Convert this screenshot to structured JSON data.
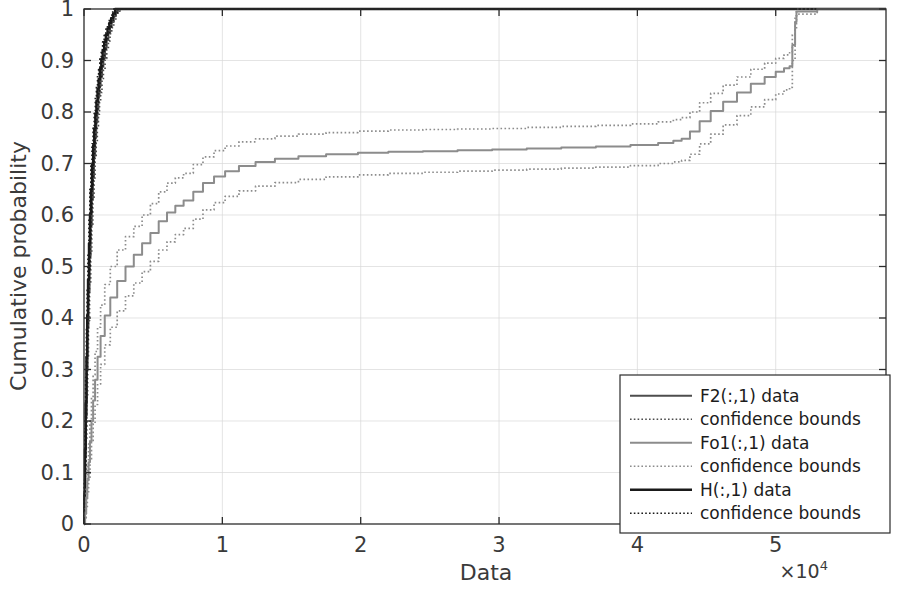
{
  "figure": {
    "title": "",
    "background_color": "#ffffff"
  },
  "axes": {
    "xlabel": "Data",
    "ylabel": "Cumulative probability",
    "x_exponent_label": "×10",
    "x_exponent_power": "4",
    "x_ticks": [
      "0",
      "1",
      "2",
      "3",
      "4",
      "5"
    ],
    "y_ticks": [
      "0",
      "0.1",
      "0.2",
      "0.3",
      "0.4",
      "0.5",
      "0.6",
      "0.7",
      "0.8",
      "0.9",
      "1"
    ]
  },
  "legend": {
    "position": "bottom-right",
    "entries": [
      {
        "label": "F2(:,1) data",
        "style": "solid",
        "color": "#4d4d4d",
        "width": 2.2
      },
      {
        "label": "confidence bounds",
        "style": "dotted",
        "color": "#4d4d4d",
        "width": 1.6
      },
      {
        "label": "Fo1(:,1) data",
        "style": "solid",
        "color": "#8c8c8c",
        "width": 2.0
      },
      {
        "label": "confidence bounds",
        "style": "dotted",
        "color": "#8c8c8c",
        "width": 1.6
      },
      {
        "label": "H(:,1) data",
        "style": "solid",
        "color": "#1a1a1a",
        "width": 2.6
      },
      {
        "label": "confidence bounds",
        "style": "dotted",
        "color": "#1a1a1a",
        "width": 1.6
      }
    ]
  },
  "chart_data": {
    "type": "line",
    "title": "",
    "xlabel": "Data",
    "ylabel": "Cumulative probability",
    "xlim": [
      0,
      57971
    ],
    "ylim": [
      0,
      1
    ],
    "x_scale_factor": 10000,
    "grid": true,
    "legend_position": "lower right",
    "series": [
      {
        "name": "F2(:,1) data",
        "style": "solid",
        "color": "#4d4d4d",
        "x": [
          0,
          40,
          90,
          140,
          200,
          260,
          320,
          400,
          480,
          560,
          640,
          720,
          800,
          880,
          960,
          1040,
          1120,
          1200,
          1300,
          1400,
          1520,
          1640,
          1760,
          1880,
          2000,
          2150,
          2300,
          2450
        ],
        "y": [
          0,
          0.055,
          0.13,
          0.21,
          0.3,
          0.38,
          0.45,
          0.52,
          0.58,
          0.63,
          0.675,
          0.715,
          0.75,
          0.78,
          0.805,
          0.83,
          0.85,
          0.868,
          0.888,
          0.905,
          0.925,
          0.94,
          0.953,
          0.965,
          0.975,
          0.986,
          0.995,
          1.0
        ]
      },
      {
        "name": "F2 upper confidence bound",
        "style": "dotted",
        "color": "#4d4d4d",
        "x": [
          0,
          40,
          90,
          140,
          200,
          260,
          320,
          400,
          480,
          560,
          640,
          720,
          800,
          880,
          960,
          1040,
          1120,
          1200,
          1300,
          1400,
          1520,
          1640,
          1760,
          1880,
          2000,
          2150,
          2300
        ],
        "y": [
          0,
          0.08,
          0.17,
          0.26,
          0.355,
          0.435,
          0.505,
          0.575,
          0.63,
          0.678,
          0.72,
          0.757,
          0.79,
          0.818,
          0.84,
          0.862,
          0.88,
          0.896,
          0.914,
          0.928,
          0.944,
          0.957,
          0.968,
          0.978,
          0.986,
          0.995,
          1.0
        ]
      },
      {
        "name": "F2 lower confidence bound",
        "style": "dotted",
        "color": "#4d4d4d",
        "x": [
          0,
          40,
          90,
          140,
          200,
          260,
          320,
          400,
          480,
          560,
          640,
          720,
          800,
          880,
          960,
          1040,
          1120,
          1200,
          1300,
          1400,
          1520,
          1640,
          1760,
          1880,
          2000,
          2150,
          2300,
          2450,
          2600
        ],
        "y": [
          0,
          0.035,
          0.095,
          0.165,
          0.245,
          0.325,
          0.395,
          0.465,
          0.528,
          0.582,
          0.63,
          0.672,
          0.71,
          0.742,
          0.77,
          0.796,
          0.818,
          0.838,
          0.862,
          0.882,
          0.904,
          0.922,
          0.938,
          0.952,
          0.964,
          0.978,
          0.988,
          0.996,
          1.0
        ]
      },
      {
        "name": "H(:,1) data",
        "style": "solid",
        "color": "#1a1a1a",
        "x": [
          0,
          30,
          70,
          120,
          175,
          230,
          290,
          360,
          430,
          500,
          580,
          660,
          740,
          820,
          900,
          980,
          1060,
          1150,
          1250,
          1350,
          1460,
          1580,
          1700,
          1830,
          1960,
          2100,
          2250
        ],
        "y": [
          0,
          0.06,
          0.145,
          0.235,
          0.325,
          0.405,
          0.475,
          0.545,
          0.602,
          0.65,
          0.697,
          0.735,
          0.768,
          0.797,
          0.822,
          0.845,
          0.864,
          0.884,
          0.903,
          0.92,
          0.936,
          0.95,
          0.962,
          0.973,
          0.982,
          0.991,
          1.0
        ]
      },
      {
        "name": "H upper confidence bound",
        "style": "dotted",
        "color": "#1a1a1a",
        "x": [
          0,
          30,
          70,
          120,
          175,
          230,
          290,
          360,
          430,
          500,
          580,
          660,
          740,
          820,
          900,
          980,
          1060,
          1150,
          1250,
          1350,
          1460,
          1580,
          1700,
          1830,
          1960,
          2080
        ],
        "y": [
          0,
          0.085,
          0.185,
          0.285,
          0.378,
          0.458,
          0.528,
          0.595,
          0.65,
          0.695,
          0.738,
          0.773,
          0.802,
          0.828,
          0.85,
          0.87,
          0.887,
          0.905,
          0.921,
          0.936,
          0.949,
          0.961,
          0.971,
          0.98,
          0.988,
          1.0
        ]
      },
      {
        "name": "H lower confidence bound",
        "style": "dotted",
        "color": "#1a1a1a",
        "x": [
          0,
          30,
          70,
          120,
          175,
          230,
          290,
          360,
          430,
          500,
          580,
          660,
          740,
          820,
          900,
          980,
          1060,
          1150,
          1250,
          1350,
          1460,
          1580,
          1700,
          1830,
          1960,
          2100,
          2250,
          2420
        ],
        "y": [
          0,
          0.04,
          0.11,
          0.19,
          0.275,
          0.355,
          0.425,
          0.495,
          0.555,
          0.606,
          0.657,
          0.698,
          0.734,
          0.766,
          0.794,
          0.819,
          0.841,
          0.863,
          0.885,
          0.903,
          0.922,
          0.938,
          0.952,
          0.965,
          0.975,
          0.985,
          0.993,
          1.0
        ]
      },
      {
        "name": "Fo1(:,1) data",
        "style": "solid",
        "color": "#8c8c8c",
        "x": [
          0,
          80,
          160,
          240,
          330,
          430,
          540,
          660,
          800,
          980,
          1200,
          1500,
          1900,
          2400,
          3000,
          3600,
          4200,
          4800,
          5400,
          6000,
          6600,
          7200,
          7900,
          8600,
          9400,
          10200,
          11200,
          12400,
          13800,
          15500,
          17500,
          19800,
          22000,
          24500,
          27000,
          29500,
          32000,
          34500,
          37000,
          39500,
          41500,
          42600,
          43200,
          43800,
          44500,
          45300,
          46200,
          47200,
          48200,
          49200,
          50000,
          50600,
          51000,
          51200,
          51400,
          51500,
          53000,
          55000,
          57971
        ],
        "y": [
          0,
          0.02,
          0.05,
          0.085,
          0.12,
          0.16,
          0.2,
          0.24,
          0.28,
          0.325,
          0.365,
          0.405,
          0.44,
          0.472,
          0.5,
          0.523,
          0.545,
          0.565,
          0.588,
          0.605,
          0.618,
          0.628,
          0.645,
          0.662,
          0.675,
          0.685,
          0.695,
          0.703,
          0.709,
          0.714,
          0.718,
          0.721,
          0.723,
          0.724,
          0.7255,
          0.727,
          0.729,
          0.731,
          0.733,
          0.736,
          0.74,
          0.744,
          0.748,
          0.762,
          0.782,
          0.802,
          0.82,
          0.838,
          0.855,
          0.868,
          0.878,
          0.885,
          0.889,
          0.93,
          0.975,
          0.995,
          1.0,
          1.0,
          1.0
        ]
      },
      {
        "name": "Fo1 upper confidence bound",
        "style": "dotted",
        "color": "#8c8c8c",
        "x": [
          0,
          80,
          160,
          240,
          330,
          430,
          540,
          660,
          800,
          980,
          1200,
          1500,
          1900,
          2400,
          3000,
          3600,
          4200,
          4800,
          5400,
          6000,
          6600,
          7200,
          7900,
          8600,
          9400,
          10200,
          11200,
          12400,
          13800,
          15500,
          17500,
          19800,
          22000,
          24500,
          27000,
          29500,
          32000,
          34500,
          37000,
          39500,
          41500,
          42600,
          43200,
          43800,
          44500,
          45300,
          46200,
          47200,
          48200,
          49200,
          50000,
          50600,
          51000,
          51200,
          51400,
          51500,
          53000,
          55000,
          57971
        ],
        "y": [
          0,
          0.03,
          0.07,
          0.115,
          0.155,
          0.2,
          0.245,
          0.29,
          0.335,
          0.382,
          0.425,
          0.465,
          0.5,
          0.532,
          0.558,
          0.578,
          0.6,
          0.622,
          0.645,
          0.662,
          0.672,
          0.681,
          0.698,
          0.713,
          0.725,
          0.734,
          0.742,
          0.748,
          0.753,
          0.757,
          0.76,
          0.763,
          0.765,
          0.766,
          0.767,
          0.768,
          0.77,
          0.772,
          0.774,
          0.777,
          0.781,
          0.785,
          0.789,
          0.8,
          0.818,
          0.836,
          0.852,
          0.868,
          0.883,
          0.895,
          0.904,
          0.911,
          0.915,
          0.95,
          0.985,
          1.0,
          1.0,
          1.0,
          1.0
        ]
      },
      {
        "name": "Fo1 lower confidence bound",
        "style": "dotted",
        "color": "#8c8c8c",
        "x": [
          0,
          80,
          160,
          240,
          330,
          430,
          540,
          660,
          800,
          980,
          1200,
          1500,
          1900,
          2400,
          3000,
          3600,
          4200,
          4800,
          5400,
          6000,
          6600,
          7200,
          7900,
          8600,
          9400,
          10200,
          11200,
          12400,
          13800,
          15500,
          17500,
          19800,
          22000,
          24500,
          27000,
          29500,
          32000,
          34500,
          37000,
          39500,
          41500,
          42600,
          43200,
          43800,
          44500,
          45300,
          46200,
          47200,
          48200,
          49200,
          50000,
          50600,
          51000,
          51200,
          51400,
          51500,
          53000,
          55000,
          57971
        ],
        "y": [
          0,
          0.012,
          0.032,
          0.058,
          0.088,
          0.122,
          0.158,
          0.195,
          0.232,
          0.272,
          0.31,
          0.348,
          0.382,
          0.414,
          0.443,
          0.468,
          0.49,
          0.51,
          0.532,
          0.548,
          0.562,
          0.574,
          0.592,
          0.61,
          0.624,
          0.636,
          0.647,
          0.656,
          0.663,
          0.669,
          0.674,
          0.678,
          0.681,
          0.683,
          0.685,
          0.687,
          0.689,
          0.691,
          0.693,
          0.696,
          0.7,
          0.703,
          0.706,
          0.718,
          0.738,
          0.757,
          0.775,
          0.793,
          0.81,
          0.824,
          0.835,
          0.843,
          0.848,
          0.9,
          0.96,
          0.99,
          1.0,
          1.0,
          1.0
        ]
      }
    ]
  }
}
